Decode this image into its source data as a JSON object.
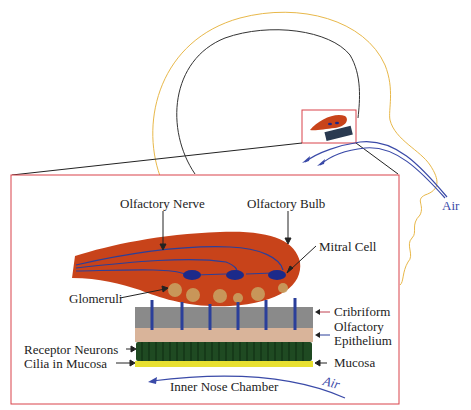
{
  "diagram": {
    "labels": {
      "olfactory_nerve": "Olfactory Nerve",
      "olfactory_bulb": "Olfactory Bulb",
      "mitral_cell": "Mitral Cell",
      "glomeruli": "Glomeruli",
      "cribriform": "Cribriform",
      "olfactory_epithelium_1": "Olfactory",
      "olfactory_epithelium_2": "Epithelium",
      "receptor_neurons": "Receptor Neurons",
      "cilia_in_mucosa": "Cilia in Mucosa",
      "mucosa": "Mucosa",
      "inner_nose_chamber": "Inner Nose Chamber",
      "air_inner": "Air",
      "air_outer": "Air"
    },
    "colors": {
      "head_outline": "#e8b84a",
      "brain_outline": "#333333",
      "zoom_box": "#d9434a",
      "bulb_fill": "#c8431a",
      "nerve": "#2b3f9a",
      "mitral": "#1c2a8a",
      "glomeruli": "#c9a060",
      "cribriform": "#8a8a8a",
      "epithelium": "#d9b49a",
      "receptor": "#1f4a22",
      "mucosa": "#e8e030",
      "air_arrow": "#3a4aa8"
    }
  }
}
